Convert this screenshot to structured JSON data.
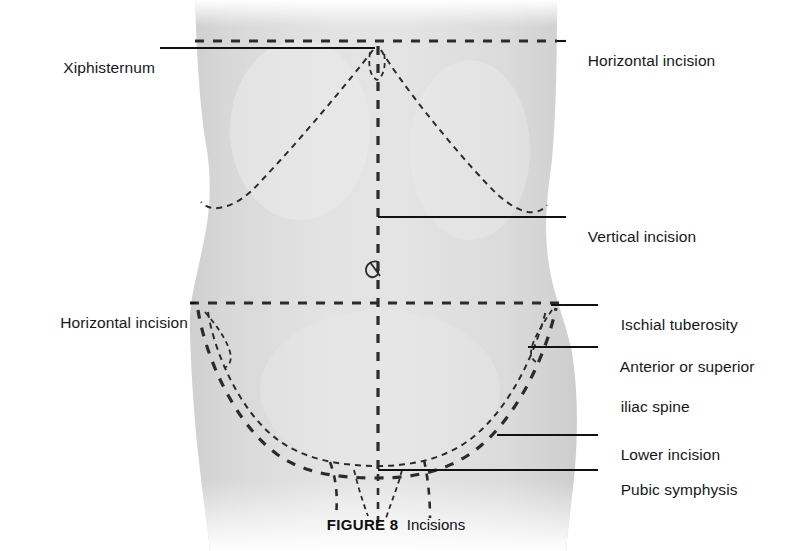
{
  "figure": {
    "caption_label": "FIGURE 8",
    "caption_text": "Incisions"
  },
  "colors": {
    "background": "#ffffff",
    "body_fill": "#d9d9d9",
    "body_fill_light": "#e6e6e6",
    "ink": "#1a1a1a",
    "dash_ink": "#2b2b2b",
    "text": "#15181a"
  },
  "labels": {
    "xiphisternum": "Xiphisternum",
    "horizontal_incision_top": "Horizontal incision",
    "vertical_incision": "Vertical incision",
    "horizontal_incision_left": "Horizontal incision",
    "ischial_tuberosity": "Ischial tuberosity",
    "iliac_spine_line1": "Anterior or superior",
    "iliac_spine_line2": "iliac spine",
    "lower_incision": "Lower incision",
    "pubic_symphysis": "Pubic symphysis"
  },
  "annotations": [
    {
      "name": "xiphisternum",
      "text": "Xiphisternum",
      "side": "left",
      "target_x": 375,
      "target_y": 48
    },
    {
      "name": "horizontal-incision-top",
      "text": "Horizontal incision",
      "side": "right",
      "target_x": 557,
      "target_y": 41
    },
    {
      "name": "vertical-incision",
      "text": "Vertical incision",
      "side": "right",
      "target_x": 378,
      "target_y": 217
    },
    {
      "name": "horizontal-incision-left",
      "text": "Horizontal incision",
      "side": "left",
      "target_x": 196,
      "target_y": 303
    },
    {
      "name": "ischial-tuberosity",
      "text": "Ischial tuberosity",
      "side": "right",
      "target_x": 551,
      "target_y": 305
    },
    {
      "name": "anterior-or-superior-iliac-spine",
      "text": "Anterior or superior iliac spine",
      "side": "right",
      "target_x": 528,
      "target_y": 347
    },
    {
      "name": "lower-incision",
      "text": "Lower incision",
      "side": "right",
      "target_x": 497,
      "target_y": 435
    },
    {
      "name": "pubic-symphysis",
      "text": "Pubic symphysis",
      "side": "right",
      "target_x": 378,
      "target_y": 470
    }
  ],
  "incision_lines": [
    {
      "name": "horizontal-incision-upper",
      "style": "dashed",
      "orientation": "horizontal",
      "y": 41,
      "x_start": 195,
      "x_end": 557
    },
    {
      "name": "horizontal-incision-lower",
      "style": "dashed",
      "orientation": "horizontal",
      "y": 303,
      "x_start": 190,
      "x_end": 566
    },
    {
      "name": "vertical-incision-midline",
      "style": "dashed",
      "orientation": "vertical",
      "x": 378,
      "y_start": 48,
      "y_end": 470
    },
    {
      "name": "lower-incision-curve",
      "style": "dashed",
      "orientation": "curve"
    },
    {
      "name": "costal-margin-left",
      "style": "dashed",
      "orientation": "curve"
    },
    {
      "name": "costal-margin-right",
      "style": "dashed",
      "orientation": "curve"
    },
    {
      "name": "inguinal-crease",
      "style": "dashed",
      "orientation": "curve"
    }
  ],
  "landmarks": [
    {
      "name": "umbilicus",
      "x": 373,
      "y": 268
    },
    {
      "name": "xiphisternum-point",
      "x": 375,
      "y": 48
    },
    {
      "name": "pubic-symphysis-point",
      "x": 378,
      "y": 470
    }
  ]
}
